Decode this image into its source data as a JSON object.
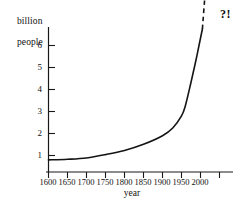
{
  "chart_data": {
    "type": "line",
    "title": "",
    "subtitle": "",
    "xlabel": "year",
    "ylabel_lines": [
      "billion",
      "people"
    ],
    "ylabel": "billion people",
    "xlim": [
      1600,
      2050
    ],
    "ylim": [
      0,
      6.8
    ],
    "grid": false,
    "legend": null,
    "xticks": [
      1600,
      1650,
      1700,
      1750,
      1800,
      1850,
      1900,
      1950,
      2000
    ],
    "xtick_labels": [
      "1600",
      "1650",
      "1700",
      "1750",
      "1800",
      "1850",
      "1900",
      "1950",
      "2000"
    ],
    "yticks": [
      1,
      2,
      3,
      4,
      5,
      6
    ],
    "ytick_labels": [
      "1",
      "2",
      "3",
      "4",
      "5",
      "6"
    ],
    "series": [
      {
        "name": "world population",
        "style": "solid",
        "color": "#141414",
        "x": [
          1600,
          1650,
          1700,
          1750,
          1800,
          1850,
          1900,
          1927,
          1950,
          1960,
          1974,
          1987,
          1999,
          2005
        ],
        "y": [
          0.55,
          0.58,
          0.64,
          0.79,
          0.98,
          1.26,
          1.65,
          2.0,
          2.55,
          3.0,
          4.0,
          5.0,
          6.0,
          6.5
        ]
      },
      {
        "name": "extrapolation",
        "style": "dashed",
        "color": "#141414",
        "x": [
          2005,
          2012
        ],
        "y": [
          6.5,
          8.1
        ]
      }
    ],
    "annotations": [
      {
        "text": "?!",
        "x": 2035,
        "y": 7.9
      }
    ]
  },
  "axis": {
    "x_axis_name": "x-axis",
    "y_axis_name": "y-axis"
  }
}
